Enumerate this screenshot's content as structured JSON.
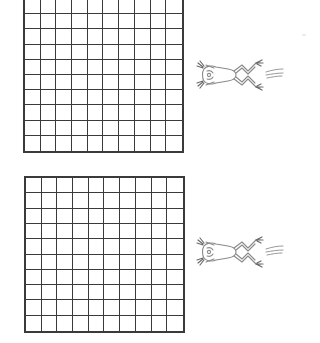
{
  "worksheet": {
    "grids": [
      {
        "id": "grid-top",
        "rows": 10,
        "columns": 10,
        "line_color": "#3a3a3a",
        "partially_cropped": true
      },
      {
        "id": "grid-bottom",
        "rows": 10,
        "columns": 10,
        "line_color": "#3a3a3a",
        "partially_cropped": false
      }
    ],
    "illustrations": [
      {
        "id": "frog-top",
        "icon": "leaping-frog-icon",
        "direction": "left",
        "motion_lines": 3
      },
      {
        "id": "frog-bottom",
        "icon": "leaping-frog-icon",
        "direction": "left",
        "motion_lines": 3
      }
    ],
    "colors": {
      "background": "#ffffff",
      "grid_lines": "#3a3a3a",
      "illustration_lines": "#8a8a8a"
    }
  }
}
